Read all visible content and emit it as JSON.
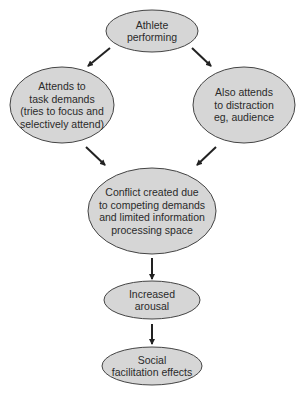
{
  "diagram": {
    "colors": {
      "node_fill": "#d6d6d6",
      "node_stroke": "#444444",
      "arrow": "#222222",
      "text": "#2a2a2a",
      "background": "#ffffff"
    },
    "nodes": [
      {
        "id": "athlete",
        "lines": [
          "Athlete",
          "performing"
        ],
        "cx": 152,
        "cy": 31,
        "rx": 46,
        "ry": 21
      },
      {
        "id": "task",
        "lines": [
          "Attends to",
          "task demands",
          "(tries to focus and",
          "selectively attend)"
        ],
        "cx": 62,
        "cy": 105,
        "rx": 52,
        "ry": 38
      },
      {
        "id": "distraction",
        "lines": [
          "Also attends",
          "to distraction",
          "eg, audience"
        ],
        "cx": 244,
        "cy": 105,
        "rx": 51,
        "ry": 38
      },
      {
        "id": "conflict",
        "lines": [
          "Conflict created due",
          "to competing demands",
          "and limited information",
          "processing space"
        ],
        "cx": 152,
        "cy": 211,
        "rx": 64,
        "ry": 43
      },
      {
        "id": "arousal",
        "lines": [
          "Increased",
          "arousal"
        ],
        "cx": 152,
        "cy": 300,
        "rx": 48,
        "ry": 19
      },
      {
        "id": "social",
        "lines": [
          "Social",
          "facilitation effects"
        ],
        "cx": 152,
        "cy": 366,
        "rx": 50,
        "ry": 19
      }
    ],
    "edges": [
      {
        "from": "athlete",
        "to": "task",
        "x1": 110,
        "y1": 48,
        "x2": 88,
        "y2": 66
      },
      {
        "from": "athlete",
        "to": "distraction",
        "x1": 192,
        "y1": 48,
        "x2": 211,
        "y2": 66
      },
      {
        "from": "task",
        "to": "conflict",
        "x1": 86,
        "y1": 147,
        "x2": 105,
        "y2": 165
      },
      {
        "from": "distraction",
        "to": "conflict",
        "x1": 216,
        "y1": 147,
        "x2": 197,
        "y2": 165
      },
      {
        "from": "conflict",
        "to": "arousal",
        "x1": 152,
        "y1": 258,
        "x2": 152,
        "y2": 279
      },
      {
        "from": "arousal",
        "to": "social",
        "x1": 152,
        "y1": 324,
        "x2": 152,
        "y2": 344
      }
    ]
  }
}
